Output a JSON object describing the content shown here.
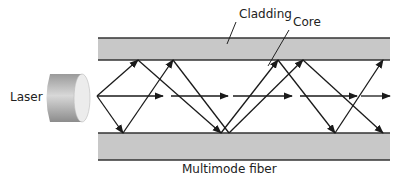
{
  "diagram": {
    "title": "Multimode fiber",
    "labels": {
      "laser": "Laser",
      "cladding": "Cladding",
      "core": "Core",
      "caption": "Multimode fiber"
    },
    "colors": {
      "cladding_fill": "#c8c8c8",
      "border": "#333333",
      "ray": "#1a1a1a",
      "laser_dark": "#8a8a8a",
      "laser_light": "#e6e6e6"
    },
    "rays": [
      {
        "name": "ray-high-angle-1",
        "points": [
          [
            97,
            96
          ],
          [
            138,
            60
          ],
          [
            221,
            133
          ],
          [
            278,
            60
          ],
          [
            335,
            133
          ],
          [
            383,
            60
          ]
        ]
      },
      {
        "name": "ray-high-angle-2",
        "points": [
          [
            97,
            96
          ],
          [
            123,
            133
          ],
          [
            173,
            60
          ],
          [
            229,
            133
          ],
          [
            303,
            60
          ],
          [
            383,
            133
          ]
        ]
      },
      {
        "name": "ray-axial",
        "segments": [
          [
            97,
            163
          ],
          [
            171,
            228
          ],
          [
            233,
            292
          ],
          [
            300,
            357
          ],
          [
            361,
            390
          ]
        ]
      }
    ]
  }
}
